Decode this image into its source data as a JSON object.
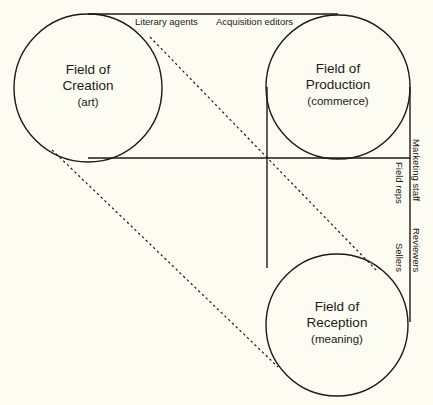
{
  "diagram": {
    "background_color": "#fdfcf3",
    "line_color": "#1a1a18",
    "nodes": [
      {
        "id": "creation",
        "name": "Field of Creation",
        "line1": "Field of",
        "line2": "Creation",
        "qualifier": "(art)",
        "cx": 88,
        "cy": 88,
        "r": 74
      },
      {
        "id": "production",
        "name": "Field of Production",
        "line1": "Field of",
        "line2": "Production",
        "qualifier": "(commerce)",
        "cx": 338,
        "cy": 87,
        "r": 72
      },
      {
        "id": "reception",
        "name": "Field of Reception",
        "line1": "Field of",
        "line2": "Reception",
        "qualifier": "(meaning)",
        "cx": 337,
        "cy": 325,
        "r": 71
      }
    ],
    "edge_labels": [
      {
        "id": "literary-agents",
        "text": "Literary agents",
        "orientation": "horizontal"
      },
      {
        "id": "acquisition-editors",
        "text": "Acquisition editors",
        "orientation": "horizontal"
      },
      {
        "id": "field-reps",
        "text": "Field reps",
        "orientation": "vertical"
      },
      {
        "id": "marketing-staff",
        "text": "Marketing staff",
        "orientation": "vertical"
      },
      {
        "id": "sellers",
        "text": "Sellers",
        "orientation": "vertical"
      },
      {
        "id": "reviewers",
        "text": "Reviewers",
        "orientation": "vertical"
      }
    ],
    "connectors": [
      {
        "id": "top-tangent",
        "style": "solid",
        "from": "creation",
        "to": "production"
      },
      {
        "id": "mid-horizontal",
        "style": "solid",
        "from": "creation",
        "to": "production-left"
      },
      {
        "id": "inner-vertical",
        "style": "solid",
        "from": "production-left",
        "to": "reception-top"
      },
      {
        "id": "outer-vertical",
        "style": "solid",
        "from": "production-right",
        "to": "reception-right"
      },
      {
        "id": "creation-to-reception-upper",
        "style": "dashed",
        "from": "creation",
        "to": "reception"
      },
      {
        "id": "creation-to-reception-lower",
        "style": "dashed",
        "from": "creation",
        "to": "reception"
      }
    ]
  }
}
